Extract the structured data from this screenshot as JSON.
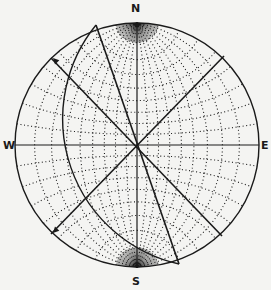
{
  "diagram": {
    "type": "stereographic-net",
    "labels": {
      "north": "N",
      "south": "S",
      "west": "W",
      "east": "E"
    },
    "grid_interval_deg": 10,
    "colors": {
      "background": "#f4f4f2",
      "ink": "#1a1a1a"
    },
    "geometry": {
      "center": [
        137,
        145
      ],
      "radius": 122
    },
    "features": [
      {
        "kind": "great-circle-arc",
        "points": [
          [
            96,
            25
          ],
          [
            65,
            145
          ],
          [
            179,
            264
          ]
        ]
      },
      {
        "kind": "line",
        "from": [
          96,
          25
        ],
        "to": [
          179,
          264
        ]
      },
      {
        "kind": "line",
        "from": [
          224,
          56
        ],
        "to": [
          51,
          234
        ],
        "arrow_at": [
          53,
          233
        ]
      },
      {
        "kind": "line",
        "from": [
          51,
          58
        ],
        "to": [
          222,
          236
        ],
        "arrow_at": [
          53,
          58
        ]
      }
    ]
  }
}
